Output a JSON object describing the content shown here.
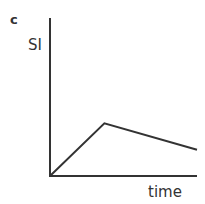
{
  "panel": {
    "label": "c"
  },
  "chart_data": {
    "type": "line",
    "title": "",
    "xlabel": "time",
    "ylabel": "SI",
    "grid": false,
    "legend": null,
    "x": [
      0,
      1,
      2.7
    ],
    "series": [
      {
        "name": "SI",
        "values": [
          0,
          1,
          0.5
        ]
      }
    ],
    "xlim": [
      0,
      2.7
    ],
    "ylim": [
      0,
      3
    ],
    "annotations": [
      "Linear rise to peak, then slow linear decline"
    ]
  },
  "colors": {
    "line": "#333333",
    "axis": "#333333"
  }
}
